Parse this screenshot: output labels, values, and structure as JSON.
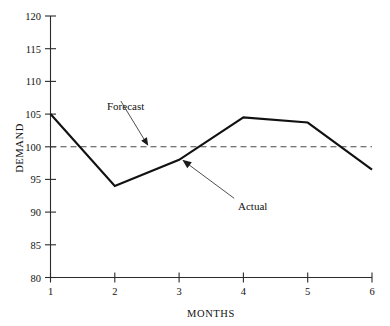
{
  "chart_data": {
    "type": "line",
    "title": "",
    "xlabel": "MONTHS",
    "ylabel": "DEMAND",
    "xlim": [
      1,
      6
    ],
    "ylim": [
      80,
      120
    ],
    "xticks": [
      1,
      2,
      3,
      4,
      5,
      6
    ],
    "yticks": [
      80,
      85,
      90,
      95,
      100,
      105,
      110,
      115,
      120
    ],
    "grid": false,
    "legend_position": "inline-annotations",
    "categories": [
      1,
      2,
      3,
      4,
      5,
      6
    ],
    "series": [
      {
        "name": "Actual",
        "style": "solid",
        "color": "#111111",
        "values": [
          105,
          94,
          98,
          104.5,
          103.7,
          96.5
        ]
      },
      {
        "name": "Forecast",
        "style": "dashed",
        "color": "#4a4a4a",
        "values": [
          100,
          100,
          100,
          100,
          100,
          100
        ]
      }
    ],
    "annotations": [
      {
        "text": "Forecast",
        "label_x": 2.0,
        "label_y": 107.3,
        "target_x": 2.52,
        "target_y": 100.0
      },
      {
        "text": "Actual",
        "label_x": 3.95,
        "label_y": 91.5,
        "target_x": 3.05,
        "target_y": 98.3
      }
    ]
  },
  "axes": {
    "y_tick_labels": [
      "120",
      "115",
      "110",
      "105",
      "100",
      "95",
      "90",
      "85",
      "80"
    ],
    "x_tick_labels": [
      "1",
      "2",
      "3",
      "4",
      "5",
      "6"
    ],
    "y_axis_title": "DEMAND",
    "x_axis_title": "MONTHS"
  },
  "annotation_labels": {
    "forecast": "Forecast",
    "actual": "Actual"
  },
  "colors": {
    "actual_line": "#111111",
    "forecast_line": "#4a4a4a",
    "axis": "#2b2b2b",
    "text": "#111111",
    "background": "#ffffff"
  }
}
